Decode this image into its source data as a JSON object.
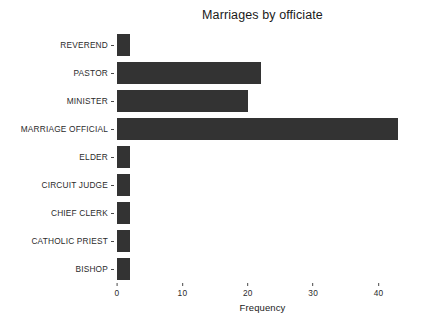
{
  "chart_data": {
    "type": "bar",
    "orientation": "horizontal",
    "title": "Marriages by officiate",
    "xlabel": "Frequency",
    "ylabel": "",
    "categories": [
      "REVEREND",
      "PASTOR",
      "MINISTER",
      "MARRIAGE OFFICIAL",
      "ELDER",
      "CIRCUIT JUDGE",
      "CHIEF CLERK",
      "CATHOLIC PRIEST",
      "BISHOP"
    ],
    "values": [
      2,
      22,
      20,
      43,
      2,
      2,
      2,
      2,
      2
    ],
    "xticks": [
      0,
      10,
      20,
      30,
      40
    ],
    "xlim": [
      0,
      44.5
    ],
    "grid": false,
    "legend": false,
    "bar_color": "#333333",
    "background_color": "#ffffff",
    "text_color": "#1a1a1a"
  }
}
